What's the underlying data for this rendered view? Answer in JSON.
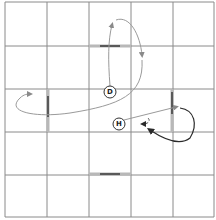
{
  "diagram": {
    "title": "",
    "grid": {
      "rows": 5,
      "cols": 5
    },
    "nodes": [
      {
        "id": "D",
        "label": "D"
      },
      {
        "id": "H",
        "label": "H"
      }
    ],
    "walls": [
      {
        "id": "wall-top-center",
        "orientation": "horizontal",
        "position": "between row 1 and row 2, column 3"
      },
      {
        "id": "wall-left",
        "orientation": "vertical",
        "position": "between column 1 and column 2, row 3"
      },
      {
        "id": "wall-right",
        "orientation": "vertical",
        "position": "between column 4 and column 5, row 3"
      },
      {
        "id": "wall-bottom-center",
        "orientation": "horizontal",
        "position": "between row 4 and row 5, column 3"
      }
    ],
    "paths": [
      {
        "id": "D-up-loop",
        "from": "D",
        "style": "light",
        "description": "from D up through top wall gap, loop right and back down"
      },
      {
        "id": "D-left-loop",
        "from": "D",
        "style": "light",
        "description": "from D around to the left past left wall"
      },
      {
        "id": "H-right",
        "from": "H",
        "style": "light",
        "description": "from H to the right past right wall"
      },
      {
        "id": "H-short-dashed",
        "from": "H",
        "style": "dashed",
        "description": "short dashed return arrow near H"
      },
      {
        "id": "right-loop-dark",
        "from": "right wall",
        "style": "dark",
        "description": "dark loop from right wall curving back toward H"
      }
    ]
  }
}
